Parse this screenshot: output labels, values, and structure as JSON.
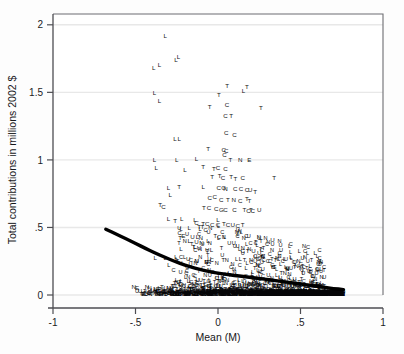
{
  "figure": {
    "background": "#fdfdfd",
    "plot_background": "#ffffff",
    "frame_color": "#4d4d52",
    "grid_color": "#e8e8e8",
    "marker_color": "#111114",
    "fit_line_color": "#000000"
  },
  "chart_data": {
    "type": "scatter",
    "title": "",
    "subtitle": "",
    "xlabel": "Mean (M)",
    "ylabel": "Total contributions in millions 2002 $",
    "xlim": [
      -1,
      1
    ],
    "ylim": [
      0,
      2.08
    ],
    "xticks": [
      -1,
      -0.5,
      0,
      0.5,
      1
    ],
    "xticklabels": [
      "-1",
      "-.5",
      "0",
      ".5",
      "1"
    ],
    "yticks": [
      0,
      0.5,
      1,
      1.5,
      2
    ],
    "yticklabels": [
      "0",
      ".5",
      "1",
      "1.5",
      "2"
    ],
    "grid": "horizontal",
    "legend": "none",
    "marker_style": "letter-glyph",
    "marker_categories": [
      "L",
      "C",
      "T",
      "N",
      "U"
    ],
    "annotations": [],
    "fit_line": {
      "name": "lowess fit",
      "style": "thick solid black curve",
      "points": [
        [
          -0.68,
          0.487
        ],
        [
          -0.62,
          0.452
        ],
        [
          -0.56,
          0.418
        ],
        [
          -0.5,
          0.382
        ],
        [
          -0.44,
          0.345
        ],
        [
          -0.38,
          0.31
        ],
        [
          -0.32,
          0.278
        ],
        [
          -0.26,
          0.248
        ],
        [
          -0.2,
          0.221
        ],
        [
          -0.14,
          0.198
        ],
        [
          -0.08,
          0.18
        ],
        [
          -0.02,
          0.166
        ],
        [
          0.04,
          0.155
        ],
        [
          0.1,
          0.145
        ],
        [
          0.16,
          0.136
        ],
        [
          0.22,
          0.127
        ],
        [
          0.28,
          0.118
        ],
        [
          0.34,
          0.108
        ],
        [
          0.4,
          0.098
        ],
        [
          0.46,
          0.088
        ],
        [
          0.52,
          0.078
        ],
        [
          0.58,
          0.068
        ],
        [
          0.64,
          0.058
        ],
        [
          0.7,
          0.048
        ],
        [
          0.76,
          0.04
        ]
      ]
    },
    "points": [
      {
        "label": "L",
        "x": -0.32,
        "y": 1.915
      },
      {
        "label": "L",
        "x": -0.39,
        "y": 1.675
      },
      {
        "label": "L",
        "x": -0.355,
        "y": 1.7
      },
      {
        "label": "L",
        "x": -0.255,
        "y": 1.735
      },
      {
        "label": "L",
        "x": -0.24,
        "y": 1.76
      },
      {
        "label": "L",
        "x": -0.385,
        "y": 1.495
      },
      {
        "label": "L",
        "x": -0.355,
        "y": 1.435
      },
      {
        "label": "L",
        "x": 0.155,
        "y": 1.505
      },
      {
        "label": "L",
        "x": -0.26,
        "y": 1.155
      },
      {
        "label": "L",
        "x": -0.235,
        "y": 1.155
      },
      {
        "label": "L",
        "x": -0.385,
        "y": 0.995
      },
      {
        "label": "L",
        "x": -0.25,
        "y": 0.995
      },
      {
        "label": "L",
        "x": -0.375,
        "y": 0.935
      },
      {
        "label": "L",
        "x": -0.2,
        "y": 0.92
      },
      {
        "label": "T",
        "x": 0.055,
        "y": 1.545
      },
      {
        "label": "T",
        "x": 0.175,
        "y": 1.535
      },
      {
        "label": "T",
        "x": 0.005,
        "y": 1.48
      },
      {
        "label": "C",
        "x": 0.055,
        "y": 1.405
      },
      {
        "label": "T",
        "x": -0.05,
        "y": 1.39
      },
      {
        "label": "T",
        "x": 0.26,
        "y": 1.38
      },
      {
        "label": "C",
        "x": 0.045,
        "y": 1.32
      },
      {
        "label": "T",
        "x": 0.08,
        "y": 1.325
      },
      {
        "label": "C",
        "x": 0.05,
        "y": 1.195
      },
      {
        "label": "C",
        "x": 0.1,
        "y": 1.18
      },
      {
        "label": "T",
        "x": -0.06,
        "y": 1.075
      },
      {
        "label": "C",
        "x": 0.035,
        "y": 1.07
      },
      {
        "label": "C",
        "x": 0.05,
        "y": 1.06
      },
      {
        "label": "C",
        "x": 0.04,
        "y": 1.035
      },
      {
        "label": "L",
        "x": -0.13,
        "y": 1.005
      },
      {
        "label": "T",
        "x": 0.075,
        "y": 1.0
      },
      {
        "label": "N",
        "x": 0.135,
        "y": 1.0
      },
      {
        "label": "E",
        "x": 0.19,
        "y": 1.0
      },
      {
        "label": "T",
        "x": -0.09,
        "y": 0.945
      },
      {
        "label": "T",
        "x": -0.025,
        "y": 0.93
      },
      {
        "label": "C",
        "x": 0.0,
        "y": 0.935
      },
      {
        "label": "C",
        "x": 0.045,
        "y": 0.93
      },
      {
        "label": "T",
        "x": -0.035,
        "y": 0.87
      },
      {
        "label": "T",
        "x": 0.01,
        "y": 0.88
      },
      {
        "label": "C",
        "x": 0.03,
        "y": 0.865
      },
      {
        "label": "T",
        "x": 0.08,
        "y": 0.87
      },
      {
        "label": "T",
        "x": 0.105,
        "y": 0.855
      },
      {
        "label": "C",
        "x": 0.15,
        "y": 0.86
      },
      {
        "label": "T",
        "x": 0.34,
        "y": 0.865
      },
      {
        "label": "L",
        "x": -0.3,
        "y": 0.79
      },
      {
        "label": "T",
        "x": -0.235,
        "y": 0.8
      },
      {
        "label": "L",
        "x": -0.09,
        "y": 0.8
      },
      {
        "label": "C",
        "x": 0.005,
        "y": 0.79
      },
      {
        "label": "O",
        "x": 0.035,
        "y": 0.79
      },
      {
        "label": "N",
        "x": 0.045,
        "y": 0.78
      },
      {
        "label": "C",
        "x": 0.105,
        "y": 0.785
      },
      {
        "label": "C",
        "x": 0.14,
        "y": 0.78
      },
      {
        "label": "C",
        "x": 0.175,
        "y": 0.775
      },
      {
        "label": "U",
        "x": 0.195,
        "y": 0.775
      },
      {
        "label": "T",
        "x": 0.225,
        "y": 0.76
      },
      {
        "label": "L",
        "x": -0.29,
        "y": 0.74
      },
      {
        "label": "C",
        "x": -0.05,
        "y": 0.715
      },
      {
        "label": "C",
        "x": -0.02,
        "y": 0.72
      },
      {
        "label": "C",
        "x": 0.02,
        "y": 0.7
      },
      {
        "label": "T",
        "x": 0.06,
        "y": 0.7
      },
      {
        "label": "N",
        "x": 0.095,
        "y": 0.7
      },
      {
        "label": "C",
        "x": 0.135,
        "y": 0.69
      },
      {
        "label": "T",
        "x": 0.175,
        "y": 0.705
      },
      {
        "label": "T",
        "x": 0.19,
        "y": 0.69
      },
      {
        "label": "T",
        "x": -0.35,
        "y": 0.66
      },
      {
        "label": "C",
        "x": -0.33,
        "y": 0.65
      },
      {
        "label": "T",
        "x": -0.085,
        "y": 0.64
      },
      {
        "label": "C",
        "x": -0.055,
        "y": 0.64
      },
      {
        "label": "C",
        "x": -0.01,
        "y": 0.635
      },
      {
        "label": "G",
        "x": 0.02,
        "y": 0.63
      },
      {
        "label": "C",
        "x": 0.045,
        "y": 0.625
      },
      {
        "label": "C",
        "x": 0.1,
        "y": 0.625
      },
      {
        "label": "T",
        "x": 0.16,
        "y": 0.625
      },
      {
        "label": "C",
        "x": 0.185,
        "y": 0.62
      },
      {
        "label": "T",
        "x": 0.2,
        "y": 0.625
      },
      {
        "label": "C",
        "x": 0.21,
        "y": 0.62
      },
      {
        "label": "U",
        "x": 0.25,
        "y": 0.63
      },
      {
        "label": "L",
        "x": -0.3,
        "y": 0.56
      },
      {
        "label": "T",
        "x": -0.26,
        "y": 0.545
      },
      {
        "label": "L",
        "x": -0.22,
        "y": 0.56
      },
      {
        "label": "L",
        "x": -0.14,
        "y": 0.555
      },
      {
        "label": "L",
        "x": 0.0,
        "y": 0.555
      },
      {
        "label": "C",
        "x": -0.13,
        "y": 0.53
      },
      {
        "label": "T",
        "x": -0.09,
        "y": 0.525
      },
      {
        "label": "C",
        "x": -0.065,
        "y": 0.52
      },
      {
        "label": "C",
        "x": -0.035,
        "y": 0.515
      },
      {
        "label": "C",
        "x": 0.0,
        "y": 0.515
      },
      {
        "label": "T",
        "x": 0.035,
        "y": 0.52
      },
      {
        "label": "C",
        "x": 0.06,
        "y": 0.515
      },
      {
        "label": "U",
        "x": 0.09,
        "y": 0.512
      },
      {
        "label": "C",
        "x": 0.12,
        "y": 0.51
      },
      {
        "label": "T",
        "x": 0.15,
        "y": 0.512
      },
      {
        "label": "T",
        "x": -0.115,
        "y": 0.5
      },
      {
        "label": "T",
        "x": -0.095,
        "y": 0.498
      },
      {
        "label": "L",
        "x": -0.175,
        "y": 0.49
      },
      {
        "label": "E",
        "x": -0.21,
        "y": 0.435
      },
      {
        "label": "T",
        "x": -0.23,
        "y": 0.42
      },
      {
        "label": "U",
        "x": -0.155,
        "y": 0.43
      },
      {
        "label": "L",
        "x": -0.125,
        "y": 0.425
      },
      {
        "label": "N",
        "x": -0.105,
        "y": 0.42
      },
      {
        "label": "L",
        "x": -0.175,
        "y": 0.4
      },
      {
        "label": "U",
        "x": -0.13,
        "y": 0.39
      },
      {
        "label": "N",
        "x": -0.1,
        "y": 0.385
      },
      {
        "label": "L",
        "x": -0.06,
        "y": 0.4
      },
      {
        "label": "U",
        "x": 0.33,
        "y": 0.405
      },
      {
        "label": "L",
        "x": -0.225,
        "y": 0.335
      },
      {
        "label": "U",
        "x": -0.115,
        "y": 0.345
      },
      {
        "label": "U",
        "x": -0.065,
        "y": 0.33
      },
      {
        "label": "L",
        "x": -0.04,
        "y": 0.33
      },
      {
        "label": "C",
        "x": 0.15,
        "y": 0.325
      },
      {
        "label": "T",
        "x": 0.18,
        "y": 0.32
      },
      {
        "label": "U",
        "x": 0.215,
        "y": 0.325
      },
      {
        "label": "U",
        "x": 0.25,
        "y": 0.31
      },
      {
        "label": "L",
        "x": -0.38,
        "y": 0.27
      },
      {
        "label": "L",
        "x": -0.32,
        "y": 0.27
      },
      {
        "label": "L",
        "x": -0.25,
        "y": 0.265
      },
      {
        "label": "U",
        "x": -0.18,
        "y": 0.265
      },
      {
        "label": "C",
        "x": -0.165,
        "y": 0.255
      },
      {
        "label": "N",
        "x": -0.13,
        "y": 0.25
      },
      {
        "label": "E",
        "x": -0.07,
        "y": 0.245
      },
      {
        "label": "N",
        "x": -0.055,
        "y": 0.245
      },
      {
        "label": "U",
        "x": 0.225,
        "y": 0.25
      },
      {
        "label": "U",
        "x": 0.265,
        "y": 0.24
      },
      {
        "label": "N",
        "x": 0.475,
        "y": 0.215
      },
      {
        "label": "N",
        "x": -0.51,
        "y": 0.06
      },
      {
        "label": "E",
        "x": -0.49,
        "y": 0.05
      },
      {
        "label": "N",
        "x": -0.43,
        "y": 0.058
      },
      {
        "label": "N",
        "x": -0.415,
        "y": 0.05
      },
      {
        "label": "T",
        "x": -0.34,
        "y": 0.055
      },
      {
        "label": "U",
        "x": 0.64,
        "y": 0.04
      },
      {
        "label": "N",
        "x": 0.7,
        "y": 0.035
      },
      {
        "label": "W",
        "x": 0.735,
        "y": 0.03
      }
    ]
  },
  "axes": {
    "x_axis_name": "Mean (M)",
    "y_axis_name": "Total contributions in millions 2002 $"
  }
}
